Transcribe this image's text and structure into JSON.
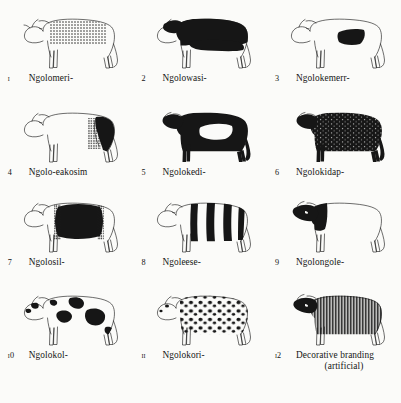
{
  "plate": {
    "title": "Karimojong cattle colour-pattern terms",
    "columns": 3,
    "rows": 4,
    "ink_color": "#161616",
    "paper_color": "#fbfbf9"
  },
  "figures": [
    {
      "number": "ı",
      "name": "Ngolomeri-",
      "pattern": "fine dots over back and upper body, white ground",
      "icon": "cow-icon"
    },
    {
      "number": "2",
      "name": "Ngolowasi-",
      "pattern": "dark head, neck and back; white lower body and legs",
      "icon": "cow-icon"
    },
    {
      "number": "3",
      "name": "Ngolokemerr-",
      "pattern": "white ground with single dark patch on mid back",
      "icon": "cow-icon"
    },
    {
      "number": "4",
      "name": "Ngolo-eakosim",
      "pattern": "white fore body, dark speckled hindquarters",
      "icon": "cow-icon"
    },
    {
      "number": "5",
      "name": "Ngolokedi-",
      "pattern": "solid dark body with white patch on flank",
      "icon": "cow-icon"
    },
    {
      "number": "6",
      "name": "Ngolokidap-",
      "pattern": "dark body flecked with small white speckles",
      "icon": "cow-icon"
    },
    {
      "number": "7",
      "name": "Ngolosil-",
      "pattern": "white head and rear, broad dark saddle over torso",
      "icon": "cow-icon"
    },
    {
      "number": "8",
      "name": "Ngoleese-",
      "pattern": "vertical dark stripes on white ground",
      "icon": "cow-icon"
    },
    {
      "number": "9",
      "name": "Ngolongole-",
      "pattern": "white body with solid dark head and neck",
      "icon": "cow-icon"
    },
    {
      "number": "ı0",
      "name": "Ngolokol-",
      "pattern": "white ground with large irregular dark blotches",
      "icon": "cow-icon"
    },
    {
      "number": "ıı",
      "name": "Ngolokori-",
      "pattern": "white ground with many small dark spots",
      "icon": "cow-icon"
    },
    {
      "number": "ı2",
      "name": "Decorative branding",
      "name_sub": "(artificial)",
      "pattern": "dense vertical hatched lines branded over whole body",
      "icon": "cow-icon"
    }
  ]
}
